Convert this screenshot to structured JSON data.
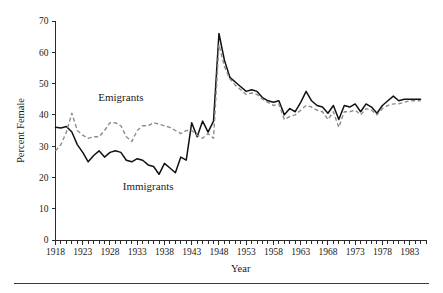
{
  "figure": {
    "background_color": "#ffffff",
    "bottom_rule": true
  },
  "chart_data": {
    "type": "line",
    "title": "",
    "subtitle": "",
    "xlabel": "Year",
    "ylabel": "Percent Female",
    "xlim": [
      1918,
      1986
    ],
    "ylim": [
      0,
      70
    ],
    "grid": false,
    "legend_position": "inline-annotations",
    "y_ticks": [
      0,
      10,
      20,
      30,
      40,
      50,
      60,
      70
    ],
    "y_tick_labels": [
      "0",
      "10",
      "20",
      "30",
      "40",
      "50",
      "60",
      "70"
    ],
    "x_ticks_labeled": [
      1918,
      1923,
      1928,
      1933,
      1938,
      1943,
      1948,
      1953,
      1958,
      1963,
      1968,
      1973,
      1978,
      1983
    ],
    "x_tick_labels": [
      "1918",
      "1923",
      "1928",
      "1933",
      "1938",
      "1943",
      "1948",
      "1953",
      "1958",
      "1963",
      "1968",
      "1973",
      "1978",
      "1983"
    ],
    "x_minor_tick_interval": 1,
    "annotations": [
      {
        "text": "Emigrants",
        "x": 1930,
        "y": 44.5
      },
      {
        "text": "Immigrants",
        "x": 1935,
        "y": 16.0
      }
    ],
    "x": [
      1918,
      1919,
      1920,
      1921,
      1922,
      1923,
      1924,
      1925,
      1926,
      1927,
      1928,
      1929,
      1930,
      1931,
      1932,
      1933,
      1934,
      1935,
      1936,
      1937,
      1938,
      1939,
      1940,
      1941,
      1942,
      1943,
      1944,
      1945,
      1946,
      1947,
      1948,
      1949,
      1950,
      1951,
      1952,
      1953,
      1954,
      1955,
      1956,
      1957,
      1958,
      1959,
      1960,
      1961,
      1962,
      1963,
      1964,
      1965,
      1966,
      1967,
      1968,
      1969,
      1970,
      1971,
      1972,
      1973,
      1974,
      1975,
      1976,
      1977,
      1978,
      1979,
      1980,
      1981,
      1982,
      1983,
      1984,
      1985
    ],
    "series": [
      {
        "name": "Immigrants",
        "style": "solid",
        "color": "#111111",
        "values": [
          36.0,
          35.8,
          36.3,
          34.5,
          30.5,
          28.0,
          25.0,
          27.0,
          28.5,
          26.5,
          28.0,
          28.5,
          28.0,
          25.5,
          25.0,
          26.0,
          25.5,
          24.0,
          23.5,
          21.0,
          24.5,
          23.0,
          21.5,
          26.5,
          25.5,
          37.5,
          33.0,
          38.0,
          34.5,
          38.0,
          66.0,
          57.5,
          52.0,
          50.5,
          49.0,
          47.5,
          48.0,
          47.5,
          45.5,
          44.5,
          44.0,
          44.5,
          40.0,
          42.0,
          41.0,
          44.0,
          47.5,
          44.5,
          43.0,
          42.5,
          40.5,
          43.0,
          38.5,
          43.0,
          42.5,
          43.5,
          41.0,
          43.5,
          42.5,
          40.5,
          43.0,
          44.5,
          46.0,
          44.5,
          45.0,
          45.0,
          45.0,
          45.0
        ]
      },
      {
        "name": "Emigrants",
        "style": "dashed",
        "color": "#8c8c8c",
        "values": [
          28.5,
          30.5,
          34.5,
          40.5,
          35.0,
          33.5,
          32.5,
          33.0,
          33.0,
          35.0,
          37.5,
          37.5,
          36.5,
          33.0,
          31.5,
          35.0,
          36.5,
          36.5,
          37.5,
          37.0,
          36.5,
          36.0,
          35.0,
          34.0,
          35.0,
          35.0,
          33.5,
          32.5,
          34.0,
          32.5,
          62.5,
          55.5,
          51.5,
          49.5,
          48.0,
          46.5,
          47.0,
          46.5,
          45.0,
          44.0,
          43.0,
          43.5,
          38.5,
          39.5,
          40.0,
          41.5,
          43.0,
          42.5,
          41.5,
          41.0,
          38.5,
          41.0,
          36.0,
          41.0,
          41.0,
          41.5,
          40.0,
          42.0,
          41.5,
          40.0,
          42.0,
          43.0,
          43.5,
          43.5,
          44.0,
          44.5,
          44.5,
          44.5
        ]
      }
    ]
  }
}
